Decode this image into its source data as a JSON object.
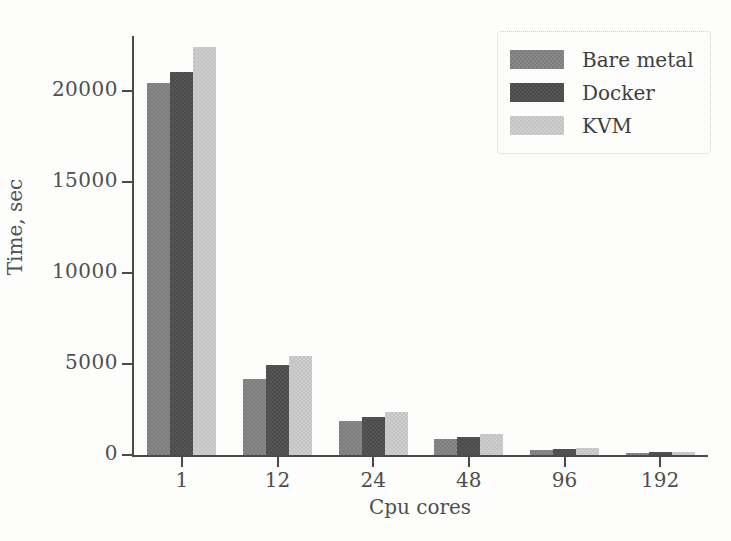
{
  "chart_data": {
    "type": "bar",
    "title": "",
    "xlabel": "Cpu cores",
    "ylabel": "Time, sec",
    "categories": [
      "1",
      "12",
      "24",
      "48",
      "96",
      "192"
    ],
    "series": [
      {
        "name": "Bare metal",
        "color": "#8a8a8a",
        "values": [
          20400,
          4200,
          1850,
          900,
          300,
          130
        ]
      },
      {
        "name": "Docker",
        "color": "#565656",
        "values": [
          21000,
          4950,
          2100,
          1000,
          350,
          150
        ]
      },
      {
        "name": "KVM",
        "color": "#cfcfcf",
        "values": [
          22400,
          5450,
          2350,
          1150,
          380,
          170
        ]
      }
    ],
    "ylim": [
      0,
      23000
    ],
    "yticks": [
      0,
      5000,
      10000,
      15000,
      20000
    ],
    "ytick_labels": [
      "0",
      "5000",
      "10000",
      "15000",
      "20000"
    ],
    "grid": false,
    "legend_position": "upper right",
    "legend_entries": [
      "Bare metal",
      "Docker",
      "KVM"
    ]
  },
  "axes": {
    "y_title": "Time, sec",
    "x_title": "Cpu cores"
  },
  "legend": {
    "items": [
      {
        "label": "Bare metal"
      },
      {
        "label": "Docker"
      },
      {
        "label": "KVM"
      }
    ]
  }
}
